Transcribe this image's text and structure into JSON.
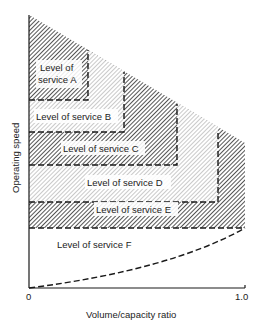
{
  "diagram": {
    "y_axis_label": "Operating speed",
    "x_axis_label": "Volume/capacity ratio",
    "x_ticks": {
      "start": "0",
      "end": "1.0"
    },
    "regions": [
      {
        "id": "A",
        "label_line1": "Level of",
        "label_line2": "service A",
        "shading": "dark-hatch"
      },
      {
        "id": "B",
        "label": "Level of service B",
        "shading": "light-hatch"
      },
      {
        "id": "C",
        "label": "Level of service C",
        "shading": "dark-hatch"
      },
      {
        "id": "D",
        "label": "Level of service D",
        "shading": "light-hatch"
      },
      {
        "id": "E",
        "label": "Level of service E",
        "shading": "dark-hatch"
      },
      {
        "id": "F",
        "label": "Level of service F",
        "shading": "none"
      }
    ],
    "colors": {
      "ink": "#1a1a1a",
      "dark_hatch": "#333333",
      "light_hatch": "#9a9a9a",
      "background": "#ffffff"
    }
  }
}
